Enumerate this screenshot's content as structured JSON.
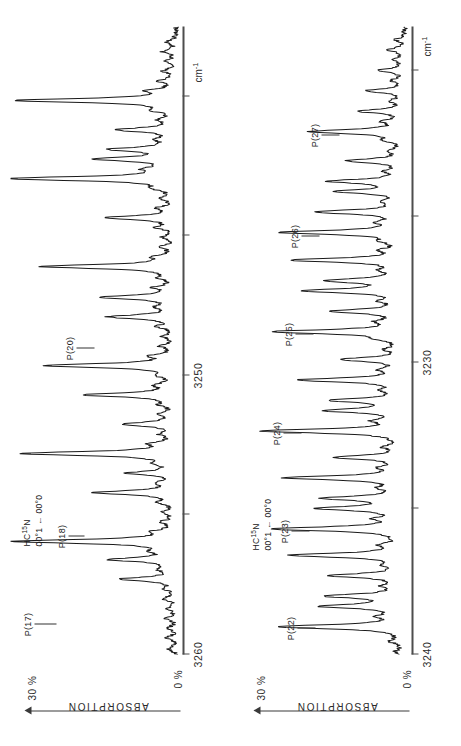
{
  "figure": {
    "orientation": "rotated-90-ccw",
    "background": "#ffffff",
    "trace_color": "#1a1a1a",
    "axis_color": "#4d4d4d"
  },
  "axis": {
    "unit_label": "cm",
    "unit_superscript": "-1",
    "y_zero_label": "0 %",
    "y_max_label": "30 %",
    "y_axis_title": "ABSORPTION"
  },
  "panels": [
    {
      "id": "panel-top",
      "species": "HC",
      "species_sup": "15",
      "species_tail": "N",
      "transition": "00°1 ← 00°0",
      "x_ticks": [
        {
          "label": "3260",
          "value": 3260
        },
        {
          "label": "",
          "value": 3255
        },
        {
          "label": "3250",
          "value": 3250
        },
        {
          "label": "",
          "value": 3245
        }
      ],
      "x_range": [
        3265.5,
        3243.0
      ],
      "peaks": [
        {
          "label": "P(17)",
          "wavenumber": 3261.45
        },
        {
          "label": "P(18)",
          "wavenumber": 3258.3
        },
        {
          "label": "P(20)",
          "wavenumber": 3251.6
        }
      ]
    },
    {
      "id": "panel-bottom",
      "species": "HC",
      "species_sup": "15",
      "species_tail": "N",
      "transition": "00°1 ← 00°0",
      "x_ticks": [
        {
          "label": "3240",
          "value": 3240
        },
        {
          "label": "",
          "value": 3235
        },
        {
          "label": "3230",
          "value": 3230
        },
        {
          "label": "",
          "value": 3225
        }
      ],
      "x_range": [
        3244.0,
        3222.5
      ],
      "peaks": [
        {
          "label": "P(22)",
          "wavenumber": 3243.05
        },
        {
          "label": "P(23)",
          "wavenumber": 3239.7
        },
        {
          "label": "P(24)",
          "wavenumber": 3236.35
        },
        {
          "label": "P(25)",
          "wavenumber": 3232.95
        },
        {
          "label": "P(26)",
          "wavenumber": 3229.55
        },
        {
          "label": "P(27)",
          "wavenumber": 3226.1
        }
      ]
    }
  ],
  "chart_data": {
    "type": "line",
    "title": "",
    "xlabel": "cm-1",
    "ylabel": "ABSORPTION",
    "grid": false,
    "legend": false,
    "ylim": [
      0,
      30
    ],
    "y_tick_labels": [
      "0 %",
      "30 %"
    ],
    "series": [
      {
        "name": "HC15N 00°1 ← 00°0 (P17-P20 region)",
        "panel": "panel-top",
        "xlim": [
          3265.5,
          3243.0
        ],
        "x_tick_labels": [
          "3260",
          "3250"
        ],
        "assigned_lines": [
          {
            "label": "P(17)",
            "x": 3261.45,
            "y": 28.5
          },
          {
            "label": "P(18)",
            "x": 3258.3,
            "y": 27.0
          },
          {
            "label": "P(20)",
            "x": 3251.6,
            "y": 23.5
          }
        ],
        "x": [
          3265.3,
          3264.9,
          3264.55,
          3264.2,
          3263.85,
          3263.5,
          3263.15,
          3262.8,
          3262.45,
          3262.1,
          3261.8,
          3261.45,
          3261.1,
          3260.75,
          3260.4,
          3260.05,
          3259.7,
          3259.35,
          3259.0,
          3258.65,
          3258.3,
          3257.95,
          3257.6,
          3257.25,
          3256.9,
          3256.55,
          3256.2,
          3255.85,
          3255.5,
          3255.15,
          3254.8,
          3254.45,
          3254.1,
          3253.75,
          3253.4,
          3253.05,
          3252.7,
          3252.35,
          3252.0,
          3251.6,
          3251.25,
          3250.9,
          3250.55,
          3250.2,
          3249.85,
          3249.5,
          3249.15,
          3248.8,
          3248.45,
          3248.1,
          3247.75,
          3247.4,
          3247.05,
          3246.7,
          3246.35,
          3246.0,
          3245.65,
          3245.3,
          3244.95,
          3244.6,
          3244.25,
          3243.9,
          3243.55
        ],
        "y": [
          1.2,
          1.6,
          1.1,
          1.8,
          1.3,
          2.0,
          1.4,
          9.5,
          2.2,
          11.0,
          2.4,
          28.5,
          3.0,
          2.1,
          1.7,
          2.6,
          14.0,
          2.3,
          8.0,
          2.5,
          27.0,
          3.2,
          2.0,
          9.0,
          2.4,
          1.9,
          16.0,
          2.8,
          2.1,
          23.0,
          3.4,
          2.2,
          1.8,
          2.6,
          11.5,
          2.3,
          13.0,
          2.9,
          2.0,
          23.5,
          3.1,
          2.2,
          1.9,
          2.7,
          12.0,
          2.4,
          2.1,
          2.8,
          29.5,
          3.6,
          13.5,
          11.0,
          2.5,
          10.0,
          2.2,
          2.9,
          28.0,
          3.8,
          2.4,
          2.0,
          1.6,
          2.2,
          1.5
        ]
      },
      {
        "name": "HC15N 00°1 ← 00°0 (P22-P27 region)",
        "panel": "panel-bottom",
        "xlim": [
          3244.0,
          3222.5
        ],
        "x_tick_labels": [
          "3240",
          "3230"
        ],
        "assigned_lines": [
          {
            "label": "P(22)",
            "x": 3243.05,
            "y": 22.0
          },
          {
            "label": "P(23)",
            "x": 3239.7,
            "y": 23.0
          },
          {
            "label": "P(24)",
            "x": 3236.35,
            "y": 24.5
          },
          {
            "label": "P(25)",
            "x": 3232.95,
            "y": 22.5
          },
          {
            "label": "P(26)",
            "x": 3229.55,
            "y": 21.0
          },
          {
            "label": "P(27)",
            "x": 3226.1,
            "y": 16.5
          }
        ],
        "x": [
          3243.9,
          3243.55,
          3243.05,
          3242.7,
          3242.35,
          3242.0,
          3241.65,
          3241.3,
          3240.95,
          3240.6,
          3240.25,
          3239.7,
          3239.35,
          3239.0,
          3238.65,
          3238.3,
          3237.95,
          3237.6,
          3237.25,
          3236.9,
          3236.35,
          3236.0,
          3235.65,
          3235.3,
          3234.95,
          3234.6,
          3234.25,
          3233.9,
          3233.55,
          3233.2,
          3232.95,
          3232.6,
          3232.25,
          3231.9,
          3231.55,
          3231.2,
          3230.85,
          3230.5,
          3230.15,
          3229.85,
          3229.55,
          3229.2,
          3228.85,
          3228.5,
          3228.15,
          3227.8,
          3227.45,
          3227.1,
          3226.75,
          3226.4,
          3226.1,
          3225.75,
          3225.4,
          3225.05,
          3224.7,
          3224.35,
          3224.0,
          3223.65,
          3223.3,
          3222.95
        ],
        "y": [
          1.4,
          2.1,
          22.0,
          3.2,
          14.0,
          13.0,
          2.6,
          12.5,
          2.3,
          19.5,
          3.0,
          23.0,
          3.4,
          14.5,
          13.5,
          2.7,
          20.5,
          3.1,
          11.5,
          2.5,
          24.5,
          3.6,
          13.0,
          12.0,
          2.6,
          18.0,
          2.9,
          10.5,
          2.4,
          2.8,
          22.5,
          3.3,
          12.5,
          2.6,
          17.0,
          13.0,
          2.7,
          19.0,
          3.0,
          2.5,
          21.0,
          3.2,
          15.0,
          2.6,
          11.0,
          12.5,
          2.4,
          9.5,
          2.2,
          2.6,
          16.5,
          2.9,
          8.0,
          2.1,
          6.5,
          2.0,
          4.5,
          1.8,
          3.0,
          1.5
        ]
      }
    ]
  }
}
